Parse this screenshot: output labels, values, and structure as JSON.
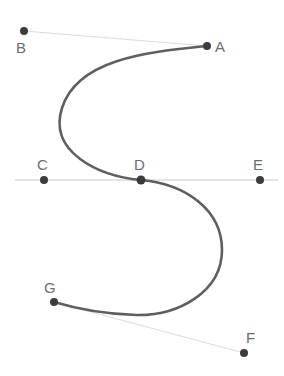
{
  "figure": {
    "width": 284,
    "height": 376,
    "background": "#ffffff"
  },
  "colors": {
    "curve": "#5f5f63",
    "point": "#3c3c3c",
    "label": "#6e6e6e",
    "guide_line": "#c9c9c9",
    "connector_line": "#dcdcdc"
  },
  "points": [
    {
      "id": "A",
      "label": "A",
      "x": 207,
      "y": 46,
      "label_x": 215,
      "label_y": 52
    },
    {
      "id": "B",
      "label": "B",
      "x": 24,
      "y": 31,
      "label_x": 16,
      "label_y": 53
    },
    {
      "id": "C",
      "label": "C",
      "x": 44,
      "y": 180,
      "label_x": 37,
      "label_y": 170
    },
    {
      "id": "D",
      "label": "D",
      "x": 141,
      "y": 180,
      "label_x": 134,
      "label_y": 170
    },
    {
      "id": "E",
      "label": "E",
      "x": 260,
      "y": 180,
      "label_x": 253,
      "label_y": 170
    },
    {
      "id": "F",
      "label": "F",
      "x": 244,
      "y": 353,
      "label_x": 246,
      "label_y": 343
    },
    {
      "id": "G",
      "label": "G",
      "x": 54,
      "y": 302,
      "label_x": 44,
      "label_y": 293
    }
  ],
  "guide_line": {
    "name": "horizontal-axis",
    "x1": 15,
    "y1": 180,
    "x2": 278,
    "y2": 180
  },
  "connector_lines": [
    {
      "name": "connector-B-A",
      "from": "B",
      "to": "A",
      "x1": 24,
      "y1": 31,
      "x2": 207,
      "y2": 46
    },
    {
      "name": "connector-G-F",
      "from": "G",
      "to": "F",
      "x1": 54,
      "y1": 302,
      "x2": 244,
      "y2": 353
    }
  ],
  "curve": {
    "name": "s-curve",
    "stroke_width": 2.6,
    "path": "M 207 46 C 150 52, 78 58, 62 108 C 48 152, 98 176, 141 180 C 186 184, 222 210, 222 250 C 222 292, 178 316, 136 315 C 104 314, 74 308, 54 302",
    "description": "S-shaped curve passing from A through an upper-left loop, crossing the horizontal line at D, then a lower-right loop ending at G"
  }
}
